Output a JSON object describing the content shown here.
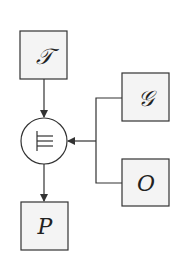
{
  "diagram": {
    "nodes": {
      "T": {
        "label": "𝒯",
        "description": "script T"
      },
      "G": {
        "label": "𝒢",
        "description": "script G"
      },
      "O": {
        "label": "O"
      },
      "P": {
        "label": "P"
      },
      "op": {
        "symbol": "⊫",
        "description": "forcing / entailment operator"
      }
    },
    "edges": [
      {
        "from": "T",
        "to": "op"
      },
      {
        "from": "G",
        "to": "op"
      },
      {
        "from": "O",
        "to": "op"
      },
      {
        "from": "op",
        "to": "P"
      }
    ]
  }
}
